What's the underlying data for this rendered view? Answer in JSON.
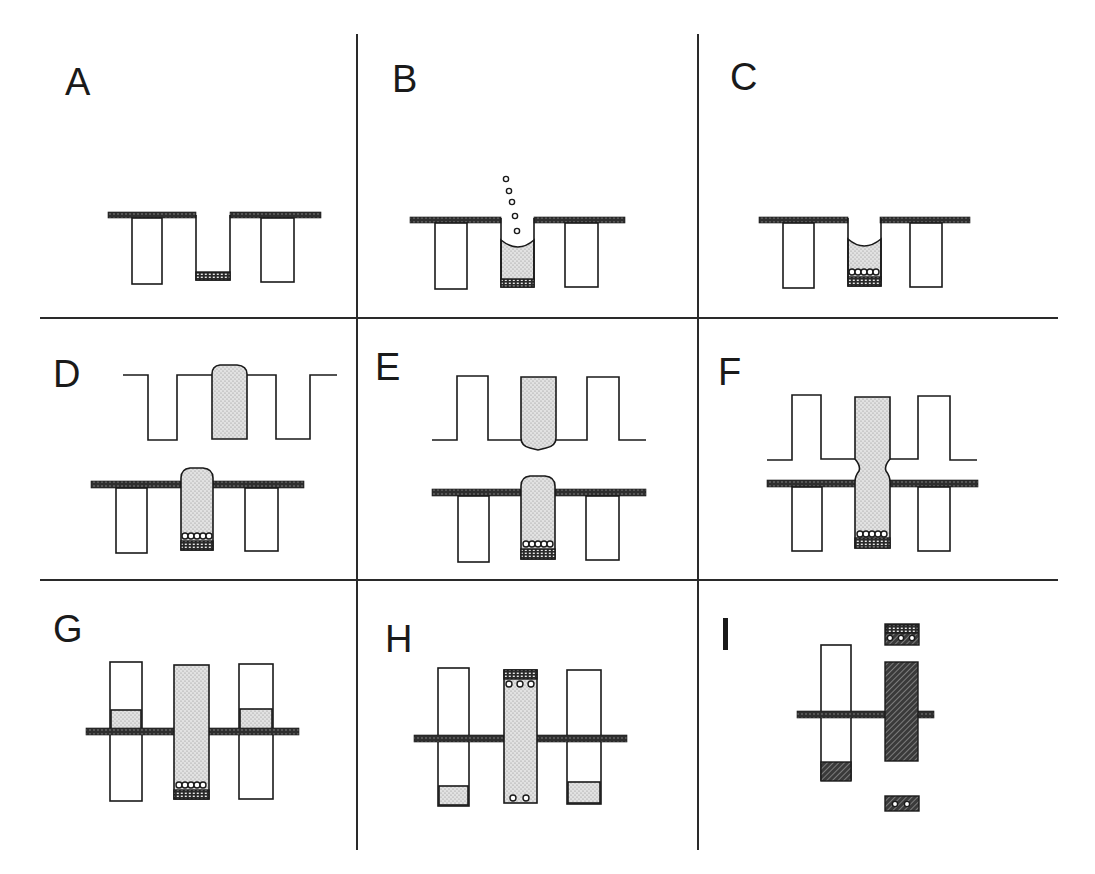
{
  "figure": {
    "layout": "3x3 grid of panels",
    "colors": {
      "ink": "#1a1a1a",
      "background": "#ffffff",
      "stipple_fill": "#d9d9d9",
      "membrane": "#3a3a3a",
      "hatch": "#2b2b2b"
    },
    "panels": [
      {
        "id": "A",
        "label": "A",
        "description": "Three wells below a dark membrane strip; center well open with a meshed plug at the bottom"
      },
      {
        "id": "B",
        "label": "B",
        "description": "Center well filled with stippled gel with concave meniscus; five small beads falling into the well"
      },
      {
        "id": "C",
        "label": "C",
        "description": "Beads settled in a row on the mesh at the bottom of the gel-filled center well"
      },
      {
        "id": "D",
        "label": "D",
        "description": "Upper inverted comb with a gel plug rounded at top; lower well with gel column domed above the membrane, beads and mesh at bottom"
      },
      {
        "id": "E",
        "label": "E",
        "description": "Upper comb (upright teeth) with gel column rounded at bottom; lower well gel domed above membrane"
      },
      {
        "id": "F",
        "label": "F",
        "description": "Upper and lower gel columns fused into one continuous column with a narrow neck at the junction"
      },
      {
        "id": "G",
        "label": "G",
        "description": "Side tubes span the membrane with stippled band above it; center gel column with beads and mesh at bottom"
      },
      {
        "id": "H",
        "label": "H",
        "description": "Assembly inverted: center column mesh at top with three beads below it and two beads at the bottom; side tubes with stippled bottom"
      },
      {
        "id": "I",
        "label": "I",
        "description": "Hatched (dark) center block spanning membrane; separate hatched mesh cap with three beads above and hatched piece with two beads below; side tube with hatched bottom"
      }
    ]
  }
}
